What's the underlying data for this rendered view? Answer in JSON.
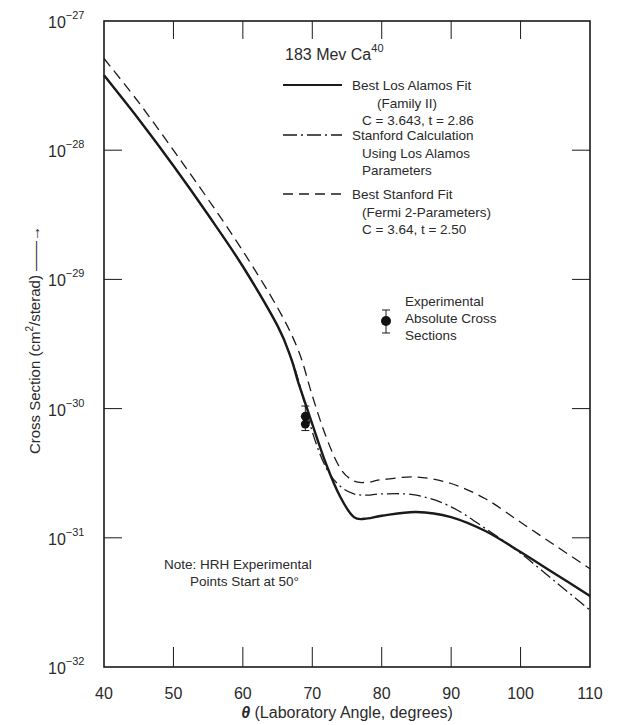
{
  "chart_data": {
    "type": "line",
    "title": "183 Mev Ca",
    "title_superscript": "40",
    "xlabel": "θ (Laboratory Angle, degrees)",
    "xlabel_symbol": "θ",
    "xlabel_rest": " (Laboratory Angle, degrees)",
    "ylabel": "Cross Section (cm²/sterad) ⟶",
    "ylabel_pre": "Cross Section (cm",
    "ylabel_sup": "2",
    "ylabel_post": "/sterad) ——→",
    "xlim": [
      40,
      110
    ],
    "ylim": [
      1e-32,
      1e-27
    ],
    "yscale": "log",
    "grid": false,
    "x_ticks": [
      40,
      50,
      60,
      70,
      80,
      90,
      100,
      110
    ],
    "x_tick_labels": [
      "40",
      "50",
      "60",
      "70",
      "80",
      "90",
      "100",
      "110"
    ],
    "y_ticks": [
      {
        "base": "10",
        "exp": "−27",
        "value": 1e-27
      },
      {
        "base": "10",
        "exp": "−28",
        "value": 1e-28
      },
      {
        "base": "10",
        "exp": "−29",
        "value": 1e-29
      },
      {
        "base": "10",
        "exp": "−30",
        "value": 1e-30
      },
      {
        "base": "10",
        "exp": "−31",
        "value": 1e-31
      },
      {
        "base": "10",
        "exp": "−32",
        "value": 1e-32
      }
    ],
    "series": [
      {
        "name": "Best Los Alamos Fit (Family II) C = 3.643, t = 2.86",
        "style": "solid",
        "x": [
          40,
          45,
          50,
          55,
          60,
          65,
          67,
          68,
          70,
          72,
          74,
          76,
          78,
          80,
          85,
          90,
          95,
          100,
          105,
          110
        ],
        "log10y": [
          -27.42,
          -27.76,
          -28.12,
          -28.5,
          -28.9,
          -29.36,
          -29.62,
          -29.8,
          -30.12,
          -30.43,
          -30.68,
          -30.84,
          -30.85,
          -30.83,
          -30.8,
          -30.84,
          -30.95,
          -31.11,
          -31.28,
          -31.45
        ]
      },
      {
        "name": "Stanford Calculation Using Los Alamos Parameters",
        "style": "dash-dot",
        "x": [
          40,
          45,
          50,
          55,
          60,
          65,
          67,
          68,
          70,
          72,
          74,
          76,
          78,
          80,
          85,
          90,
          95,
          100,
          105,
          110
        ],
        "log10y": [
          -27.42,
          -27.76,
          -28.12,
          -28.5,
          -28.9,
          -29.36,
          -29.62,
          -29.78,
          -30.18,
          -30.46,
          -30.6,
          -30.66,
          -30.67,
          -30.66,
          -30.67,
          -30.76,
          -30.93,
          -31.12,
          -31.34,
          -31.56
        ]
      },
      {
        "name": "Best Stanford Fit (Fermi 2-Parameters) C = 3.64, t = 2.50",
        "style": "dashed",
        "x": [
          40,
          45,
          50,
          55,
          60,
          65,
          68,
          70,
          72,
          74,
          76,
          78,
          80,
          85,
          90,
          95,
          100,
          105,
          110
        ],
        "log10y": [
          -27.29,
          -27.63,
          -28.0,
          -28.38,
          -28.78,
          -29.22,
          -29.55,
          -29.9,
          -30.22,
          -30.46,
          -30.56,
          -30.57,
          -30.55,
          -30.53,
          -30.58,
          -30.7,
          -30.88,
          -31.06,
          -31.24
        ]
      }
    ],
    "points": {
      "name": "Experimental Absolute Cross Sections",
      "x": [
        69,
        69
      ],
      "log10y": [
        -30.06,
        -30.12
      ],
      "err_log10_lo": [
        -30.17,
        -30.17
      ],
      "err_log10_hi": [
        -29.98,
        -29.98
      ]
    },
    "legend": {
      "position": "upper right (inside plot)",
      "entries": [
        {
          "style": "solid",
          "lines": [
            "Best Los Alamos Fit",
            "(Family II)",
            "C = 3.643, t = 2.86"
          ]
        },
        {
          "style": "dash-dot",
          "lines": [
            "Stanford Calculation",
            "Using Los Alamos",
            "Parameters"
          ]
        },
        {
          "style": "dashed",
          "lines": [
            "Best Stanford Fit",
            "(Fermi 2-Parameters)",
            "C = 3.64, t = 2.50"
          ]
        }
      ],
      "points_entry": [
        "Experimental",
        "Absolute Cross",
        "Sections"
      ]
    },
    "annotations": [
      {
        "text_lines": [
          "Note: HRH Experimental",
          "Points Start at 50°"
        ]
      }
    ]
  },
  "colors": {
    "ink": "#1a1a1a",
    "text": "#2a2a2a",
    "background": "#ffffff"
  }
}
